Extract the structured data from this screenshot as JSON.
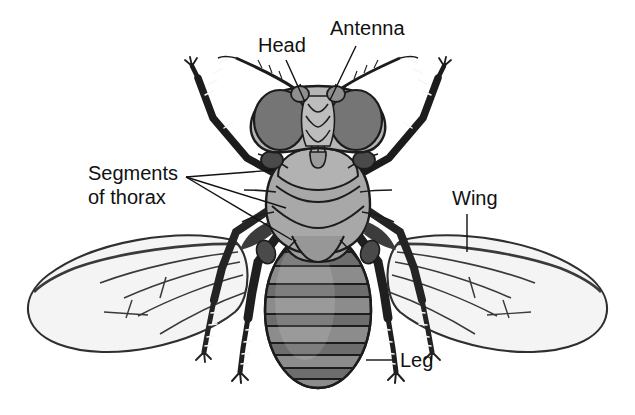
{
  "figure": {
    "background_color": "#ffffff",
    "line_color": "#111111",
    "width": 635,
    "height": 415
  },
  "labels": [
    {
      "id": "head",
      "text": "Head",
      "x": 258,
      "y": 52
    },
    {
      "id": "antenna",
      "text": "Antenna",
      "x": 330,
      "y": 35
    },
    {
      "id": "segments",
      "text_line1": "Segments",
      "text_line2": "of thorax",
      "x": 88,
      "y": 180
    },
    {
      "id": "wing",
      "text": "Wing",
      "x": 452,
      "y": 205
    },
    {
      "id": "leg",
      "text": "Leg",
      "x": 400,
      "y": 365
    }
  ],
  "palette": {
    "outline": "#111111",
    "eye": "#757575",
    "face": "#b5b5b5",
    "thorax_light": "#b2b2b2",
    "thorax_mid": "#9d9d9d",
    "thorax_dark": "#8b8b8b",
    "abdomen": "#8c8c8c",
    "abdomen_band": "#6d6d6d",
    "abdomen_light": "#a0a0a0",
    "wing_fill": "#f4f4f4",
    "wing_vein": "#3a3a3a",
    "leg_dark": "#1c1c1c",
    "leg_mid": "#2e2e2e",
    "halter": "#4a4a4a"
  },
  "parts": {
    "head_label": "head",
    "antenna_label": "antenna",
    "thorax_label": "thorax",
    "abdomen_label": "abdomen",
    "left_wing_label": "left-wing",
    "right_wing_label": "right-wing",
    "legs_count": 6
  }
}
